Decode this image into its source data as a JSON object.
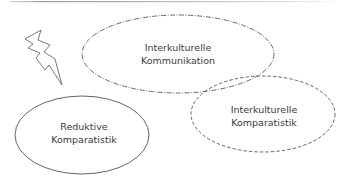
{
  "diagram": {
    "top_rule": {
      "color": "#9a9a9a"
    },
    "lightning": {
      "name": "lightning-bolt",
      "stroke": "#6a6a6a"
    },
    "nodes": [
      {
        "id": "interkulturelle-kommunikation",
        "lines": [
          "Interkulturelle",
          "Kommunikation"
        ],
        "shape": "ellipse",
        "border": "dash-dot",
        "stroke": "#555555",
        "cx": 178,
        "cy": 54,
        "rx": 96,
        "ry": 39
      },
      {
        "id": "interkulturelle-komparatistik",
        "lines": [
          "Interkulturelle",
          "Komparatistik"
        ],
        "shape": "ellipse",
        "border": "dashed",
        "stroke": "#666666",
        "cx": 263,
        "cy": 114,
        "rx": 72,
        "ry": 38
      },
      {
        "id": "reduktive-komparatistik",
        "lines": [
          "Reduktive",
          "Komparatistik"
        ],
        "shape": "ellipse",
        "border": "solid",
        "stroke": "#555555",
        "cx": 82,
        "cy": 135,
        "rx": 67,
        "ry": 39
      }
    ]
  }
}
